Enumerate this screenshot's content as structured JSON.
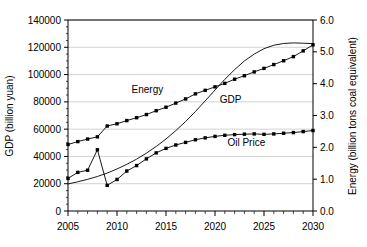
{
  "chart_data": {
    "type": "line",
    "title": "",
    "xlabel": "",
    "ylabel": "GDP (billion yuan)",
    "y2label": "Energy (billion tons coal equivalent)",
    "xlim": [
      2005,
      2030
    ],
    "ylim": [
      0,
      140000
    ],
    "y2lim": [
      0.0,
      6.0
    ],
    "grid": true,
    "grid_axis": "y",
    "legend_position": "inline-annotations",
    "x_tick_labels": [
      "2005",
      "2010",
      "2015",
      "2020",
      "2025",
      "2030"
    ],
    "x_tick_values": [
      2005,
      2010,
      2015,
      2020,
      2025,
      2030
    ],
    "x_minor_tick_interval": 1,
    "y_tick_labels": [
      "0",
      "20000",
      "40000",
      "60000",
      "80000",
      "100000",
      "120000",
      "140000"
    ],
    "y_tick_values": [
      0,
      20000,
      40000,
      60000,
      80000,
      100000,
      120000,
      140000
    ],
    "y2_tick_labels": [
      "0.0",
      "1.0",
      "2.0",
      "3.0",
      "4.0",
      "5.0",
      "6.0"
    ],
    "y2_tick_values": [
      0.0,
      1.0,
      2.0,
      3.0,
      4.0,
      5.0,
      6.0
    ],
    "x": [
      2005,
      2006,
      2007,
      2008,
      2009,
      2010,
      2011,
      2012,
      2013,
      2014,
      2015,
      2016,
      2017,
      2018,
      2019,
      2020,
      2021,
      2022,
      2023,
      2024,
      2025,
      2026,
      2027,
      2028,
      2029,
      2030
    ],
    "series": [
      {
        "name": "Energy",
        "axis": "right",
        "marker": "filled-square",
        "annotation": "Energy",
        "annotation_x": 2013.1,
        "annotation_y": 3.72,
        "values": [
          2.09,
          2.18,
          2.26,
          2.33,
          2.67,
          2.74,
          2.84,
          2.93,
          3.03,
          3.15,
          3.26,
          3.39,
          3.52,
          3.68,
          3.79,
          3.9,
          4.01,
          4.14,
          4.25,
          4.37,
          4.48,
          4.6,
          4.72,
          4.85,
          5.03,
          5.22
        ]
      },
      {
        "name": "GDP",
        "axis": "left",
        "marker": "none",
        "annotation": "GDP",
        "annotation_x": 2021.6,
        "annotation_y": 79000,
        "values": [
          19800,
          21400,
          23200,
          25300,
          27800,
          30800,
          34200,
          38000,
          42400,
          47300,
          52800,
          58900,
          65600,
          72900,
          80700,
          88700,
          96500,
          103600,
          110000,
          115000,
          119000,
          121500,
          122800,
          123200,
          123000,
          122700
        ]
      },
      {
        "name": "Oil Price",
        "axis": "left",
        "marker": "filled-square",
        "annotation": "Oil Price",
        "annotation_x": 2023.2,
        "annotation_y": 47500,
        "values": [
          23900,
          28300,
          29900,
          44900,
          18800,
          23100,
          29300,
          33300,
          38200,
          42600,
          45900,
          48400,
          50300,
          52200,
          53600,
          54700,
          55500,
          56000,
          56300,
          56500,
          56200,
          56500,
          57000,
          57500,
          58200,
          59000
        ]
      }
    ]
  },
  "axes": {
    "left_title": "GDP (billion yuan)",
    "right_title": "Energy (billion tons coal equivalent)"
  },
  "colors": {
    "line": "#000000",
    "grid": "#bfbfbf",
    "axis": "#000000",
    "background": "#ffffff"
  }
}
